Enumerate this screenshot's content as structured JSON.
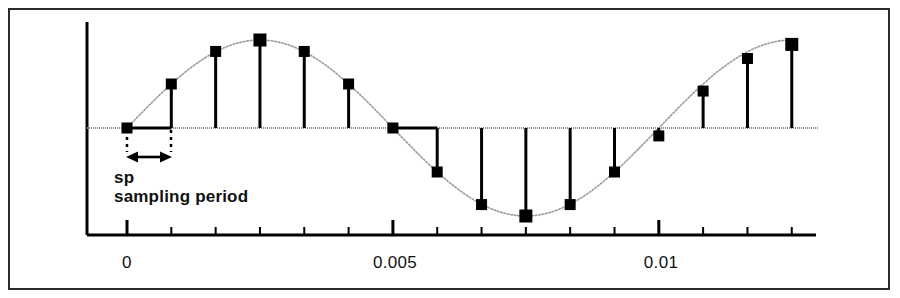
{
  "figure": {
    "title": "",
    "border_color": "#2b2b2b",
    "ink_color": "#000000",
    "curve_color": "#9a9a9a"
  },
  "annotations": {
    "sp_label": "sp",
    "sampling_period_label": "sampling period",
    "arrow_name": "sampling-period-double-arrow"
  },
  "chart_data": {
    "type": "line",
    "title": "",
    "xlabel": "",
    "ylabel": "",
    "grid": false,
    "legend": null,
    "xlim": [
      -0.0004,
      0.01325
    ],
    "ylim": [
      -1.15,
      1.15
    ],
    "xticks": [
      0,
      0.005,
      0.01
    ],
    "xtick_labels": [
      "0",
      "0.005",
      "0.01"
    ],
    "minor_xticks": [
      0.000833,
      0.001667,
      0.0025,
      0.003333,
      0.004167,
      0.005833,
      0.006667,
      0.0075,
      0.008333,
      0.009167,
      0.010833,
      0.011667,
      0.0125
    ],
    "sampling_period": 0.000833,
    "series": [
      {
        "name": "sampled sine",
        "style": "stem",
        "x": [
          0,
          0.000833,
          0.001667,
          0.0025,
          0.003333,
          0.004167,
          0.005,
          0.005833,
          0.006667,
          0.0075,
          0.008333,
          0.009167,
          0.01,
          0.010833,
          0.011667,
          0.0125
        ],
        "values": [
          0.0,
          0.5,
          0.87,
          1.0,
          0.87,
          0.5,
          0.0,
          -0.5,
          -0.87,
          -1.0,
          -0.87,
          -0.5,
          -0.09,
          0.42,
          0.79,
          0.95
        ]
      },
      {
        "name": "continuous sine",
        "style": "dotted-envelope",
        "amplitude": 1.0,
        "period": 0.01,
        "phase": 0.0
      }
    ]
  }
}
